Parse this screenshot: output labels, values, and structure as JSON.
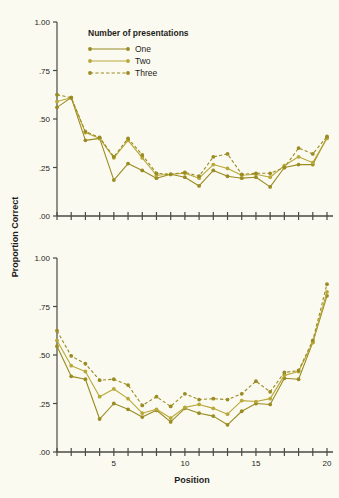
{
  "chart_data": {
    "type": "line",
    "title": "",
    "xlabel": "Position",
    "ylabel": "Proportion Correct",
    "xlim": [
      1,
      20
    ],
    "ylim": [
      0.0,
      1.0
    ],
    "grid": false,
    "legend_position": "top-center",
    "legend_title": "Number of presentations",
    "x": [
      1,
      2,
      3,
      4,
      5,
      6,
      7,
      8,
      9,
      10,
      11,
      12,
      13,
      14,
      15,
      16,
      17,
      18,
      19,
      20
    ],
    "xticks": [
      1,
      2,
      3,
      4,
      5,
      6,
      7,
      8,
      9,
      10,
      11,
      12,
      13,
      14,
      15,
      16,
      17,
      18,
      19,
      20
    ],
    "xtick_labels": [
      "",
      "",
      "",
      "",
      "5",
      "",
      "",
      "",
      "",
      "10",
      "",
      "",
      "",
      "",
      "15",
      "",
      "",
      "",
      "",
      "20"
    ],
    "yticks": [
      0.0,
      0.25,
      0.5,
      0.75,
      1.0
    ],
    "ytick_labels": [
      ".00",
      ".25",
      ".50",
      ".75",
      "1.00"
    ],
    "panels": [
      {
        "name": "top-panel",
        "xtick_labels_shown": false,
        "series": [
          {
            "name": "One",
            "line_style": "solid",
            "color": "#9a8b22",
            "values": [
              0.56,
              0.61,
              0.39,
              0.4,
              0.185,
              0.27,
              0.235,
              0.195,
              0.215,
              0.2,
              0.155,
              0.235,
              0.205,
              0.195,
              0.2,
              0.15,
              0.25,
              0.265,
              0.265,
              0.405,
              0.43,
              0.57,
              0.81
            ]
          },
          {
            "name": "Two",
            "line_style": "solid",
            "color": "#b8a83a",
            "values": [
              0.59,
              0.61,
              0.43,
              0.4,
              0.3,
              0.39,
              0.3,
              0.21,
              0.215,
              0.22,
              0.195,
              0.265,
              0.245,
              0.21,
              0.215,
              0.2,
              0.26,
              0.305,
              0.275,
              0.4,
              0.44,
              0.57,
              0.845
            ]
          },
          {
            "name": "Three",
            "line_style": "dashed",
            "color": "#9a8b22",
            "values": [
              0.625,
              0.61,
              0.435,
              0.405,
              0.305,
              0.4,
              0.315,
              0.22,
              0.215,
              0.225,
              0.205,
              0.305,
              0.32,
              0.215,
              0.22,
              0.22,
              0.25,
              0.35,
              0.32,
              0.41,
              0.445,
              0.63,
              0.92
            ]
          }
        ]
      },
      {
        "name": "bottom-panel",
        "xtick_labels_shown": true,
        "series": [
          {
            "name": "One",
            "line_style": "solid",
            "color": "#9a8b22",
            "values": [
              0.545,
              0.39,
              0.375,
              0.17,
              0.25,
              0.22,
              0.18,
              0.215,
              0.155,
              0.225,
              0.2,
              0.185,
              0.14,
              0.21,
              0.25,
              0.245,
              0.38,
              0.375,
              0.565,
              0.805
            ]
          },
          {
            "name": "Two",
            "line_style": "solid",
            "color": "#b8a83a",
            "values": [
              0.575,
              0.445,
              0.415,
              0.285,
              0.325,
              0.275,
              0.2,
              0.22,
              0.175,
              0.23,
              0.245,
              0.225,
              0.195,
              0.265,
              0.26,
              0.275,
              0.395,
              0.415,
              0.565,
              0.825
            ]
          },
          {
            "name": "Three",
            "line_style": "dashed",
            "color": "#9a8b22",
            "values": [
              0.625,
              0.495,
              0.455,
              0.37,
              0.375,
              0.345,
              0.24,
              0.285,
              0.235,
              0.3,
              0.27,
              0.275,
              0.27,
              0.3,
              0.365,
              0.31,
              0.41,
              0.42,
              0.575,
              0.865
            ]
          }
        ]
      }
    ]
  },
  "legend": {
    "title": "Number of presentations",
    "entries": [
      {
        "label": "One",
        "style": "solid",
        "color": "#9a8b22"
      },
      {
        "label": "Two",
        "style": "solid",
        "color": "#b8a83a"
      },
      {
        "label": "Three",
        "style": "dashed",
        "color": "#9a8b22"
      }
    ]
  },
  "axes": {
    "y_title": "Proportion Correct",
    "x_title": "Position"
  },
  "colors": {
    "background": "#fbfaf0",
    "axis": "#4a4a44",
    "series_one": "#9a8b22",
    "series_two": "#b8a83a",
    "series_three": "#9a8b22",
    "text": "#1d1d1b"
  }
}
